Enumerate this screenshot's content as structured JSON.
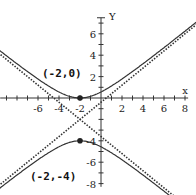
{
  "chart_data": {
    "type": "line",
    "title": "",
    "xlabel": "x",
    "ylabel": "y",
    "xlim": [
      -9.6,
      9
    ],
    "ylim": [
      -9,
      9
    ],
    "x_ticks": [
      -6,
      -4,
      -2,
      2,
      4,
      6,
      8
    ],
    "y_ticks": [
      -8,
      -6,
      -4,
      2,
      4,
      6
    ],
    "hyperbola": {
      "center": [
        -2,
        -2
      ],
      "a": 2.5,
      "b": 2,
      "orientation": "vertical"
    },
    "asymptote_slope": 0.8,
    "points": [
      {
        "x": -2,
        "y": 0,
        "label": "(-2,0)"
      },
      {
        "x": -2,
        "y": -4,
        "label": "(-2,-4)"
      }
    ],
    "series": [
      {
        "name": "hyperbola",
        "style": "solid"
      },
      {
        "name": "asymptotes",
        "style": "dotted"
      }
    ],
    "grid": false
  }
}
